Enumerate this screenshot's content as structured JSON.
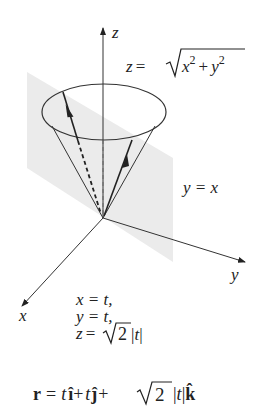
{
  "diagram": {
    "type": "3d-surface-intersection",
    "colors": {
      "background": "#ffffff",
      "ink": "#222222",
      "plane_fill": "#ebebeb",
      "axis": "#333333"
    },
    "axes": {
      "x_label": "x",
      "y_label": "y",
      "z_label": "z"
    },
    "surface_label": {
      "lhs": "z = ",
      "radicand_x": "x",
      "exp_x": "2",
      "plus": " + ",
      "radicand_y": "y",
      "exp_y": "2",
      "full": "z = √(x² + y²)"
    },
    "plane_label": "y = x",
    "parametric": {
      "line1": "x = t,",
      "line2": "y = t,",
      "line3_lhs": "z = ",
      "line3_root": "2",
      "line3_abs": " |t|",
      "full_line3": "z = √2 |t|"
    },
    "vector_equation": {
      "r": "r",
      "eq": " = ",
      "t1": "t",
      "i": "î",
      "plus1": "+ ",
      "t2": "t",
      "j": "ĵ",
      "plus2": "+",
      "root": "2",
      "abs": " |t|",
      "k": "k̂",
      "full": "r = t î + t ĵ + √2 |t| k̂"
    }
  }
}
